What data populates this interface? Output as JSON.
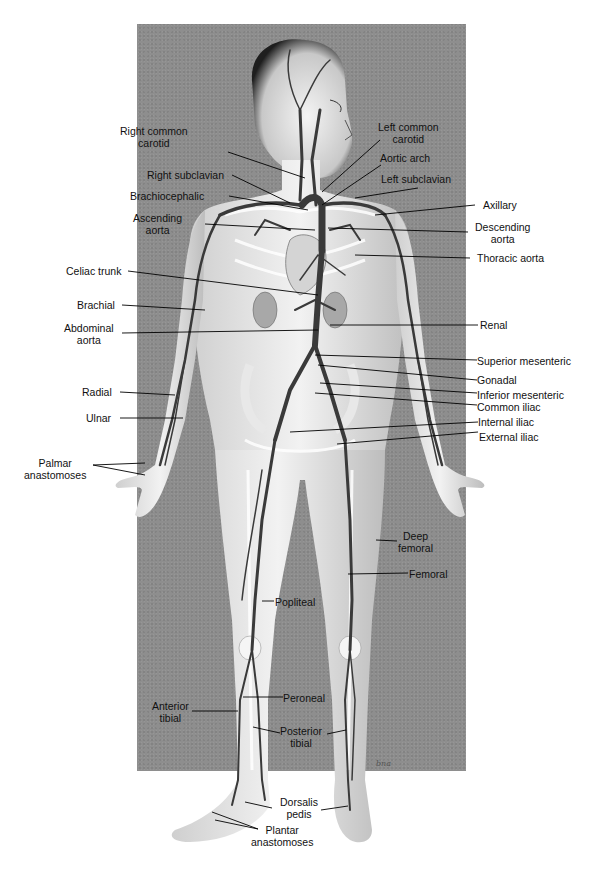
{
  "diagram": {
    "background_panel_color": "#8e8e8e",
    "artery_color": "#3a3a3a",
    "signature": "bna",
    "labels": {
      "right_common_carotid": "Right common\ncarotid",
      "left_common_carotid": "Left common\ncarotid",
      "aortic_arch": "Aortic arch",
      "right_subclavian": "Right subclavian",
      "left_subclavian": "Left subclavian",
      "brachiocephalic": "Brachiocephalic",
      "axillary": "Axillary",
      "ascending_aorta": "Ascending\naorta",
      "descending_aorta": "Descending\naorta",
      "thoracic_aorta": "Thoracic aorta",
      "celiac_trunk": "Celiac trunk",
      "brachial": "Brachial",
      "abdominal_aorta": "Abdominal\naorta",
      "renal": "Renal",
      "superior_mesenteric": "Superior mesenteric",
      "gonadal": "Gonadal",
      "inferior_mesenteric": "Inferior mesenteric",
      "common_iliac": "Common iliac",
      "radial": "Radial",
      "ulnar": "Ulnar",
      "internal_iliac": "Internal iliac",
      "external_iliac": "External iliac",
      "palmar_anastomoses": "Palmar\nanastomoses",
      "deep_femoral": "Deep\nfemoral",
      "femoral": "Femoral",
      "popliteal": "Popliteal",
      "peroneal": "Peroneal",
      "anterior_tibial": "Anterior\ntibial",
      "posterior_tibial": "Posterior\ntibial",
      "dorsalis_pedis": "Dorsalis\npedis",
      "plantar_anastomoses": "Plantar\nanastomoses"
    }
  }
}
